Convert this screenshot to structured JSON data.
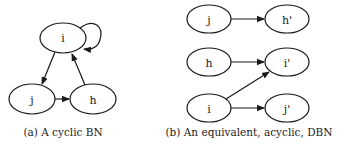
{
  "figure": {
    "panel_a": {
      "caption": "(a) A cyclic BN",
      "nodes": [
        {
          "id": "i",
          "label": "i"
        },
        {
          "id": "j",
          "label": "j"
        },
        {
          "id": "h",
          "label": "h"
        }
      ],
      "edges": [
        {
          "from": "i",
          "to": "i",
          "type": "self-loop"
        },
        {
          "from": "i",
          "to": "j"
        },
        {
          "from": "j",
          "to": "h"
        },
        {
          "from": "h",
          "to": "i"
        }
      ]
    },
    "panel_b": {
      "caption": "(b) An equivalent, acyclic, DBN",
      "nodes": [
        {
          "id": "j",
          "label": "j"
        },
        {
          "id": "h_prime",
          "label": "h'"
        },
        {
          "id": "h",
          "label": "h"
        },
        {
          "id": "i_prime",
          "label": "i'"
        },
        {
          "id": "i",
          "label": "i"
        },
        {
          "id": "j_prime",
          "label": "j'"
        }
      ],
      "edges": [
        {
          "from": "j",
          "to": "h'"
        },
        {
          "from": "h",
          "to": "i'"
        },
        {
          "from": "i",
          "to": "i'"
        },
        {
          "from": "i",
          "to": "j'"
        }
      ]
    }
  }
}
